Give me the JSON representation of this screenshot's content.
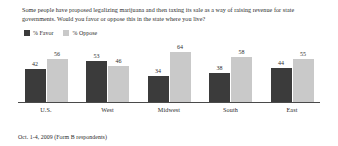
{
  "chart_data": {
    "type": "bar",
    "title": "Some people have proposed legalizing marijuana and then taxing its sale as a way of raising revenue for state governments. Would you favor or oppose this in the state where you live?",
    "xlabel": "",
    "ylabel": "",
    "ylim": [
      0,
      70
    ],
    "grid": false,
    "legend_position": "top-left",
    "categories": [
      "U.S.",
      "West",
      "Midwest",
      "South",
      "East"
    ],
    "series": [
      {
        "name": "% Favor",
        "color": "#3b3b3b",
        "values": [
          42,
          53,
          34,
          38,
          44
        ]
      },
      {
        "name": "% Oppose",
        "color": "#c9c9c9",
        "values": [
          56,
          46,
          64,
          58,
          55
        ]
      }
    ],
    "annotation": "Oct. 1-4, 2009 (Form B respondents)"
  },
  "legend": {
    "favor_label": "% Favor",
    "oppose_label": "% Oppose"
  },
  "groups": [
    {
      "category": "U.S.",
      "favor": "42",
      "oppose": "56"
    },
    {
      "category": "West",
      "favor": "53",
      "oppose": "46"
    },
    {
      "category": "Midwest",
      "favor": "34",
      "oppose": "64"
    },
    {
      "category": "South",
      "favor": "38",
      "oppose": "58"
    },
    {
      "category": "East",
      "favor": "44",
      "oppose": "55"
    }
  ],
  "footnote": "Oct. 1-4, 2009 (Form B respondents)"
}
